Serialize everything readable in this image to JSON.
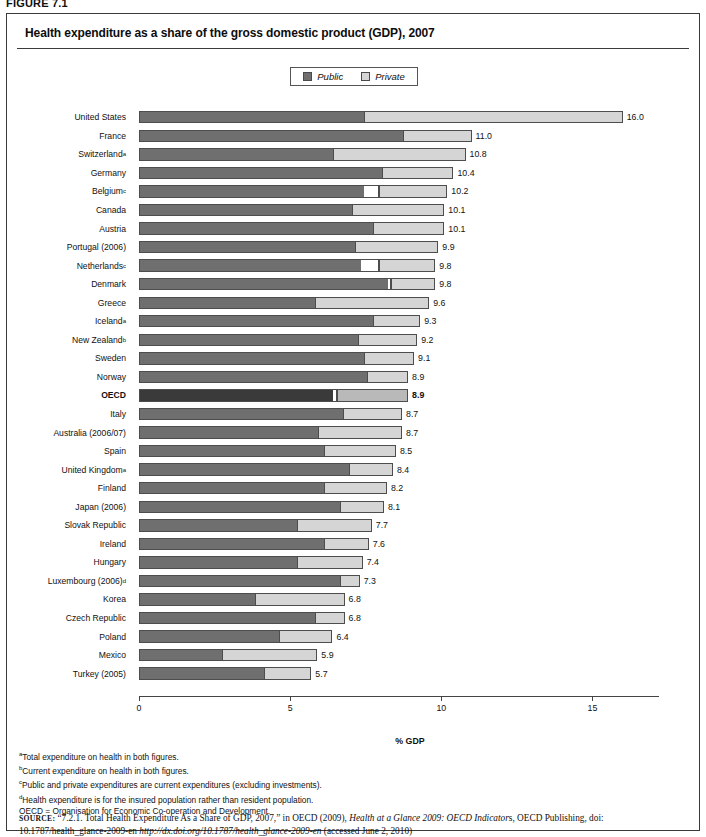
{
  "figure_number": "FIGURE 7.1",
  "chart_title": "Health expenditure as a share of the gross domestic product (GDP), 2007",
  "legend": {
    "public_label": "Public",
    "private_label": "Private",
    "public_color": "#6f6f6f",
    "private_color": "#d5d5d5"
  },
  "axis": {
    "title": "% GDP",
    "ticks": [
      "0",
      "5",
      "10",
      "15"
    ],
    "tick_values": [
      0,
      5,
      10,
      15
    ],
    "min": 0,
    "max": 17.2
  },
  "footnotes": [
    {
      "marker": "a",
      "text": "Total expenditure on health in both figures."
    },
    {
      "marker": "b",
      "text": "Current expenditure on health in both figures."
    },
    {
      "marker": "c",
      "text": "Public and private expenditures are current expenditures (excluding investments)."
    },
    {
      "marker": "d",
      "text": "Health expenditure is for the insured population rather than resident population."
    }
  ],
  "abbreviation_note": "OECD = Organisation for Economic Co-operation and Development.",
  "source": {
    "prefix": "SOURCE:",
    "part1": "“7.2.1. Total Health Expenditure As a Share of GDP, 2007,” in OECD (2009), ",
    "italic1": "Health at a Glance 2009: OECD Indicator",
    "part2": "s, OECD Publishing, doi: 10.1787/health_glance-2009-en ",
    "italic2": "http://dx.doi.org/10.1787/health_glance-2009-en",
    "part3": " (accessed June 2, 2010)"
  },
  "chart_data": {
    "type": "bar",
    "orientation": "horizontal",
    "stacked": true,
    "title": "Health expenditure as a share of the gross domestic product (GDP), 2007",
    "xlabel": "% GDP",
    "ylabel": "",
    "xlim": [
      0,
      17.2
    ],
    "grid": false,
    "legend_position": "top-center",
    "series": [
      {
        "name": "Public",
        "color": "#6f6f6f"
      },
      {
        "name": "Private",
        "color": "#d5d5d5"
      }
    ],
    "categories": [
      "United States",
      "France",
      "Switzerland",
      "Germany",
      "Belgium",
      "Canada",
      "Austria",
      "Portugal (2006)",
      "Netherlands",
      "Denmark",
      "Greece",
      "Iceland",
      "New Zealand",
      "Sweden",
      "Norway",
      "OECD",
      "Italy",
      "Australia (2006/07)",
      "Spain",
      "United Kingdom",
      "Finland",
      "Japan (2006)",
      "Slovak Republic",
      "Ireland",
      "Hungary",
      "Luxembourg (2006)",
      "Korea",
      "Czech Republic",
      "Poland",
      "Mexico",
      "Turkey (2005)"
    ],
    "rows": [
      {
        "label": "United States",
        "superscript": "",
        "total": 16.0,
        "total_label": "16.0",
        "public": 7.4,
        "gap": 0,
        "private": 8.6,
        "highlight": false
      },
      {
        "label": "France",
        "superscript": "",
        "total": 11.0,
        "total_label": "11.0",
        "public": 8.7,
        "gap": 0,
        "private": 2.3,
        "highlight": false
      },
      {
        "label": "Switzerland",
        "superscript": "a",
        "total": 10.8,
        "total_label": "10.8",
        "public": 6.4,
        "gap": 0,
        "private": 4.4,
        "highlight": false
      },
      {
        "label": "Germany",
        "superscript": "",
        "total": 10.4,
        "total_label": "10.4",
        "public": 8.0,
        "gap": 0,
        "private": 2.4,
        "highlight": false
      },
      {
        "label": "Belgium",
        "superscript": "c",
        "total": 10.2,
        "total_label": "10.2",
        "public": 7.4,
        "gap": 0.5,
        "private": 2.3,
        "highlight": false
      },
      {
        "label": "Canada",
        "superscript": "",
        "total": 10.1,
        "total_label": "10.1",
        "public": 7.0,
        "gap": 0,
        "private": 3.1,
        "highlight": false
      },
      {
        "label": "Austria",
        "superscript": "",
        "total": 10.1,
        "total_label": "10.1",
        "public": 7.7,
        "gap": 0,
        "private": 2.4,
        "highlight": false
      },
      {
        "label": "Portugal (2006)",
        "superscript": "",
        "total": 9.9,
        "total_label": "9.9",
        "public": 7.1,
        "gap": 0,
        "private": 2.8,
        "highlight": false
      },
      {
        "label": "Netherlands",
        "superscript": "c",
        "total": 9.8,
        "total_label": "9.8",
        "public": 7.3,
        "gap": 0.6,
        "private": 1.9,
        "highlight": false
      },
      {
        "label": "Denmark",
        "superscript": "",
        "total": 9.8,
        "total_label": "9.8",
        "public": 8.2,
        "gap": 0.1,
        "private": 1.5,
        "highlight": false
      },
      {
        "label": "Greece",
        "superscript": "",
        "total": 9.6,
        "total_label": "9.6",
        "public": 5.8,
        "gap": 0,
        "private": 3.8,
        "highlight": false
      },
      {
        "label": "Iceland",
        "superscript": "a",
        "total": 9.3,
        "total_label": "9.3",
        "public": 7.7,
        "gap": 0,
        "private": 1.6,
        "highlight": false
      },
      {
        "label": "New Zealand",
        "superscript": "b",
        "total": 9.2,
        "total_label": "9.2",
        "public": 7.2,
        "gap": 0,
        "private": 2.0,
        "highlight": false
      },
      {
        "label": "Sweden",
        "superscript": "",
        "total": 9.1,
        "total_label": "9.1",
        "public": 7.4,
        "gap": 0,
        "private": 1.7,
        "highlight": false
      },
      {
        "label": "Norway",
        "superscript": "",
        "total": 8.9,
        "total_label": "8.9",
        "public": 7.5,
        "gap": 0,
        "private": 1.4,
        "highlight": false
      },
      {
        "label": "OECD",
        "superscript": "",
        "total": 8.9,
        "total_label": "8.9",
        "public": 6.4,
        "gap": 0.1,
        "private": 2.4,
        "highlight": true
      },
      {
        "label": "Italy",
        "superscript": "",
        "total": 8.7,
        "total_label": "8.7",
        "public": 6.7,
        "gap": 0,
        "private": 2.0,
        "highlight": false
      },
      {
        "label": "Australia (2006/07)",
        "superscript": "",
        "total": 8.7,
        "total_label": "8.7",
        "public": 5.9,
        "gap": 0,
        "private": 2.8,
        "highlight": false
      },
      {
        "label": "Spain",
        "superscript": "",
        "total": 8.5,
        "total_label": "8.5",
        "public": 6.1,
        "gap": 0,
        "private": 2.4,
        "highlight": false
      },
      {
        "label": "United Kingdom",
        "superscript": "a",
        "total": 8.4,
        "total_label": "8.4",
        "public": 6.9,
        "gap": 0,
        "private": 1.5,
        "highlight": false
      },
      {
        "label": "Finland",
        "superscript": "",
        "total": 8.2,
        "total_label": "8.2",
        "public": 6.1,
        "gap": 0,
        "private": 2.1,
        "highlight": false
      },
      {
        "label": "Japan (2006)",
        "superscript": "",
        "total": 8.1,
        "total_label": "8.1",
        "public": 6.6,
        "gap": 0,
        "private": 1.5,
        "highlight": false
      },
      {
        "label": "Slovak Republic",
        "superscript": "",
        "total": 7.7,
        "total_label": "7.7",
        "public": 5.2,
        "gap": 0,
        "private": 2.5,
        "highlight": false
      },
      {
        "label": "Ireland",
        "superscript": "",
        "total": 7.6,
        "total_label": "7.6",
        "public": 6.1,
        "gap": 0,
        "private": 1.5,
        "highlight": false
      },
      {
        "label": "Hungary",
        "superscript": "",
        "total": 7.4,
        "total_label": "7.4",
        "public": 5.2,
        "gap": 0,
        "private": 2.2,
        "highlight": false
      },
      {
        "label": "Luxembourg (2006)",
        "superscript": "d",
        "total": 7.3,
        "total_label": "7.3",
        "public": 6.6,
        "gap": 0,
        "private": 0.7,
        "highlight": false
      },
      {
        "label": "Korea",
        "superscript": "",
        "total": 6.8,
        "total_label": "6.8",
        "public": 3.8,
        "gap": 0,
        "private": 3.0,
        "highlight": false
      },
      {
        "label": "Czech Republic",
        "superscript": "",
        "total": 6.8,
        "total_label": "6.8",
        "public": 5.8,
        "gap": 0,
        "private": 1.0,
        "highlight": false
      },
      {
        "label": "Poland",
        "superscript": "",
        "total": 6.4,
        "total_label": "6.4",
        "public": 4.6,
        "gap": 0,
        "private": 1.8,
        "highlight": false
      },
      {
        "label": "Mexico",
        "superscript": "",
        "total": 5.9,
        "total_label": "5.9",
        "public": 2.7,
        "gap": 0,
        "private": 3.2,
        "highlight": false
      },
      {
        "label": "Turkey (2005)",
        "superscript": "",
        "total": 5.7,
        "total_label": "5.7",
        "public": 4.1,
        "gap": 0,
        "private": 1.6,
        "highlight": false
      }
    ]
  }
}
